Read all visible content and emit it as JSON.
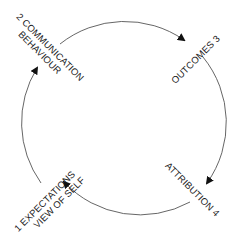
{
  "diagram": {
    "type": "cycle",
    "stroke_color": "#555555",
    "text_color": "#1a1a1a",
    "nodes": [
      {
        "number": "1",
        "lines": [
          "1 EXPECTATIONS",
          "VIEW OF SELF"
        ],
        "position": "bottom-left"
      },
      {
        "number": "2",
        "lines": [
          "2 COMMUNICATION",
          "BEHAVIOUR"
        ],
        "position": "top-left"
      },
      {
        "number": "3",
        "lines": [
          "OUTCOMES 3"
        ],
        "position": "top-right"
      },
      {
        "number": "4",
        "lines": [
          "ATTRIBUTION 4"
        ],
        "position": "bottom-right"
      }
    ],
    "flow": [
      "1 → 2",
      "2 → 3",
      "3 → 4",
      "4 → 1"
    ],
    "direction": "clockwise"
  }
}
